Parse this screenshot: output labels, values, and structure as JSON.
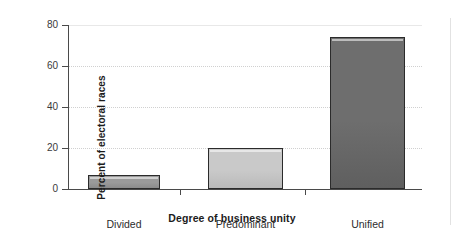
{
  "chart_data": {
    "type": "bar",
    "title": "",
    "subtitle": "",
    "xlabel": "Degree of business unity",
    "ylabel": "Percent of electoral races",
    "categories": [
      "Divided",
      "Predominant",
      "Unified"
    ],
    "values": [
      7,
      20,
      74
    ],
    "ylim": [
      0,
      80
    ],
    "yticks": [
      0,
      20,
      40,
      60,
      80
    ],
    "ytick_labels": [
      "0",
      "20",
      "40",
      "60",
      "80"
    ],
    "grid": "horizontal-dotted",
    "legend": "none",
    "bar_colors": [
      "#9a9a9a",
      "#c9c9c9",
      "#6e6e6e"
    ],
    "bar_edge_color": "#2b2b2b",
    "shadow_color": "#2e2e2e",
    "axis_color": "#4a4a4a",
    "grid_color": "#d0d0d0",
    "background": "#ffffff"
  }
}
